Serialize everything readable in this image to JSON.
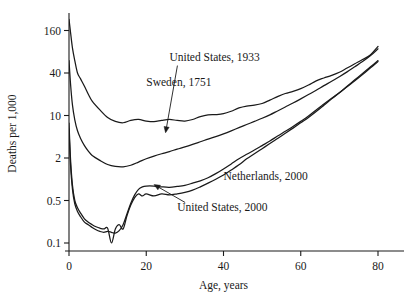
{
  "chart_data": {
    "type": "line",
    "title": "",
    "xlabel": "Age, years",
    "ylabel": "Deaths per 1,000",
    "yscale": "log",
    "xlim": [
      0,
      82
    ],
    "ylim": [
      0.085,
      260
    ],
    "grid": false,
    "legend_position": "inline-annotations",
    "xticks": [
      0,
      20,
      40,
      60,
      80
    ],
    "xticklabels": [
      "0",
      "20",
      "40",
      "60",
      "80"
    ],
    "yticks": [
      0.1,
      0.5,
      2,
      10,
      40,
      160
    ],
    "yticklabels": [
      "0.1",
      "0.5",
      "2",
      "10",
      "40",
      "160"
    ],
    "series": [
      {
        "name": "Sweden, 1751",
        "label_x": 20,
        "label_y": 26,
        "arrow": false,
        "x": [
          0,
          0.4,
          0.9,
          1.5,
          2.2,
          3,
          4,
          5,
          6,
          8,
          10,
          12,
          14,
          16,
          18,
          20,
          22,
          24,
          26,
          28,
          30,
          32,
          34,
          36,
          38,
          40,
          42,
          44,
          46,
          48,
          50,
          52,
          54,
          56,
          58,
          60,
          62,
          64,
          66,
          68,
          70,
          72,
          74,
          76,
          78,
          80
        ],
        "y": [
          230,
          150,
          90,
          60,
          40,
          33,
          26,
          20,
          16,
          12,
          9.3,
          8,
          7.6,
          8.3,
          8.6,
          8.1,
          7.9,
          8.3,
          8.6,
          8.3,
          8.1,
          8.6,
          9.6,
          10.2,
          10.3,
          10.6,
          11.5,
          12.8,
          13.6,
          14.0,
          14.8,
          16.5,
          18.5,
          20.5,
          22.0,
          24.0,
          27.0,
          31.0,
          34.0,
          37.0,
          41.0,
          47.0,
          54.0,
          62.0,
          72.0,
          95.0
        ]
      },
      {
        "name": "United States, 1933",
        "label_x": 26,
        "label_y": 60,
        "arrow": true,
        "arrow_to_x": 25,
        "arrow_to_y": 5.2,
        "x": [
          0,
          0.4,
          0.9,
          1.5,
          2.2,
          3,
          4,
          5,
          6,
          8,
          10,
          12,
          14,
          16,
          18,
          20,
          22,
          24,
          26,
          28,
          30,
          32,
          34,
          36,
          38,
          40,
          42,
          44,
          46,
          48,
          50,
          52,
          54,
          56,
          58,
          60,
          62,
          64,
          66,
          68,
          70,
          72,
          74,
          76,
          78,
          80
        ],
        "y": [
          60,
          28,
          14,
          8.5,
          5.6,
          4.2,
          3.2,
          2.6,
          2.2,
          1.85,
          1.62,
          1.52,
          1.5,
          1.58,
          1.75,
          1.95,
          2.15,
          2.35,
          2.55,
          2.8,
          3.05,
          3.35,
          3.7,
          4.1,
          4.5,
          5.0,
          5.6,
          6.3,
          7.1,
          8.0,
          9.0,
          10.2,
          11.6,
          13.2,
          15.0,
          17.2,
          19.8,
          22.8,
          26.5,
          30.5,
          35.5,
          41.5,
          49.0,
          58.0,
          70.0,
          88.0
        ]
      },
      {
        "name": "Netherlands, 2000",
        "label_x": 40,
        "label_y": 0.98,
        "arrow": false,
        "x": [
          0,
          0.4,
          0.9,
          1.5,
          2.2,
          3,
          4,
          5,
          6,
          7,
          8,
          9,
          10,
          11,
          12,
          13,
          14,
          15,
          16,
          17,
          18,
          19,
          20,
          22,
          24,
          26,
          28,
          30,
          32,
          34,
          36,
          38,
          40,
          42,
          44,
          46,
          48,
          50,
          52,
          54,
          56,
          58,
          60,
          62,
          64,
          66,
          68,
          70,
          72,
          74,
          76,
          78,
          80
        ],
        "y": [
          6.0,
          1.6,
          0.72,
          0.44,
          0.33,
          0.27,
          0.22,
          0.2,
          0.18,
          0.165,
          0.155,
          0.15,
          0.155,
          0.15,
          0.145,
          0.16,
          0.2,
          0.3,
          0.45,
          0.6,
          0.72,
          0.78,
          0.8,
          0.8,
          0.78,
          0.77,
          0.79,
          0.82,
          0.88,
          0.95,
          1.05,
          1.2,
          1.4,
          1.65,
          1.95,
          2.3,
          2.7,
          3.2,
          3.8,
          4.6,
          5.5,
          6.6,
          8.0,
          9.8,
          12.0,
          14.5,
          17.5,
          21.0,
          25.5,
          31.0,
          38.0,
          47.0,
          58.0
        ]
      },
      {
        "name": "United States, 2000",
        "label_x": 28,
        "label_y": 0.33,
        "arrow": true,
        "arrow_to_x": 22,
        "arrow_to_y": 0.84,
        "x": [
          0,
          0.4,
          0.9,
          1.5,
          2.2,
          3,
          4,
          5,
          6,
          7,
          8,
          9,
          10,
          11,
          12,
          13,
          14,
          15,
          16,
          17,
          18,
          19,
          20,
          22,
          24,
          26,
          28,
          30,
          32,
          34,
          36,
          38,
          40,
          42,
          44,
          46,
          48,
          50,
          52,
          54,
          56,
          58,
          60,
          62,
          64,
          66,
          68,
          70,
          72,
          74,
          76,
          78,
          80
        ],
        "y": [
          7.5,
          1.9,
          0.82,
          0.5,
          0.38,
          0.31,
          0.25,
          0.22,
          0.2,
          0.185,
          0.175,
          0.17,
          0.175,
          0.1,
          0.17,
          0.2,
          0.17,
          0.28,
          0.42,
          0.55,
          0.62,
          0.58,
          0.62,
          0.58,
          0.62,
          0.6,
          0.62,
          0.65,
          0.7,
          0.78,
          0.88,
          1.0,
          1.15,
          1.35,
          1.6,
          1.95,
          2.35,
          2.85,
          3.45,
          4.2,
          5.1,
          6.2,
          7.6,
          9.3,
          11.4,
          14.0,
          17.2,
          21.0,
          26.0,
          32.0,
          39.5,
          48.5,
          60.0
        ]
      }
    ]
  }
}
